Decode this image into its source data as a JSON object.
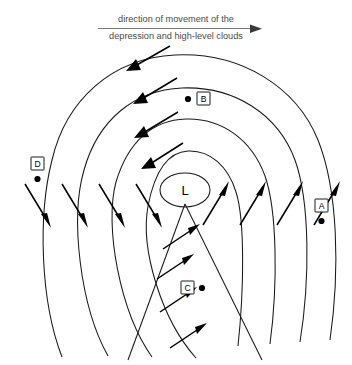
{
  "diagram": {
    "title_lines": [
      "direction of movement of the",
      "depression and high-level clouds"
    ],
    "caption_arrow": "right-arrow",
    "center": {
      "label": "L",
      "meaning": "low-pressure-centre",
      "x": 185,
      "y": 190
    },
    "points": [
      {
        "id": "A",
        "label": "A",
        "box_x": 318,
        "box_y": 203,
        "dot_x": 322,
        "dot_y": 222
      },
      {
        "id": "B",
        "label": "B",
        "box_x": 197,
        "box_y": 94,
        "dot_x": 188,
        "dot_y": 99
      },
      {
        "id": "C",
        "label": "C",
        "box_x": 182,
        "box_y": 283,
        "dot_x": 201,
        "dot_y": 288
      },
      {
        "id": "D",
        "label": "D",
        "box_x": 34,
        "box_y": 160,
        "dot_x": 38,
        "dot_y": 178
      }
    ],
    "isobars": {
      "count": 4,
      "description": "nested oval pressure contours open at the bottom",
      "centre_ellipse": {
        "cx": 185,
        "cy": 190,
        "rx": 25,
        "ry": 17
      }
    },
    "fronts": {
      "count": 2,
      "apex_x": 185,
      "apex_y": 204,
      "left_end_x": 128,
      "left_end_y": 360,
      "right_end_x": 262,
      "right_end_y": 360
    },
    "wind_arrows": {
      "top_direction": "down-left",
      "left_direction": "down-right",
      "right_direction": "up-right",
      "warm_sector_direction": "up-right",
      "circulation": "counterclockwise"
    },
    "colors": {
      "line": "#1a1a1a",
      "arrow": "#000000",
      "caption_text": "#4a4a4a",
      "background": "#ffffff"
    }
  }
}
